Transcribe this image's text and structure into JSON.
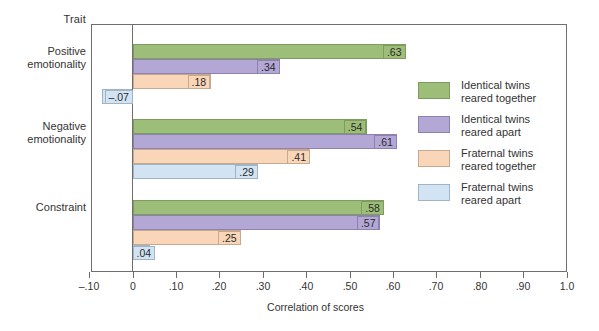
{
  "chart_data": {
    "type": "bar",
    "orientation": "horizontal",
    "title": "",
    "corner_label": "Trait",
    "xlabel": "Correlation of scores",
    "ylabel": "",
    "xlim": [
      -0.1,
      1.0
    ],
    "xticks": [
      "–.10",
      "0",
      ".10",
      ".20",
      ".30",
      ".40",
      ".50",
      ".60",
      ".70",
      ".80",
      ".90",
      "1.0"
    ],
    "xtick_values": [
      -0.1,
      0,
      0.1,
      0.2,
      0.3,
      0.4,
      0.5,
      0.6,
      0.7,
      0.8,
      0.9,
      1.0
    ],
    "grid": false,
    "legend_position": "right",
    "categories": [
      "Positive emotionality",
      "Negative emotionality",
      "Constraint"
    ],
    "category_lines": [
      [
        "Positive",
        "emotionality"
      ],
      [
        "Negative",
        "emotionality"
      ],
      [
        "Constraint",
        ""
      ]
    ],
    "series": [
      {
        "name": "Identical twins reared together",
        "legend_lines": [
          "Identical twins",
          "reared together"
        ],
        "color": "#9cbe78",
        "border": "#7e9c5f",
        "values": [
          0.63,
          0.54,
          0.58
        ],
        "labels": [
          ".63",
          ".54",
          ".58"
        ]
      },
      {
        "name": "Identical twins reared apart",
        "legend_lines": [
          "Identical twins",
          "reared apart"
        ],
        "color": "#b3a7d6",
        "border": "#8d82ad",
        "values": [
          0.34,
          0.61,
          0.57
        ],
        "labels": [
          ".34",
          ".61",
          ".57"
        ]
      },
      {
        "name": "Fraternal twins reared together",
        "legend_lines": [
          "Fraternal twins",
          "reared together"
        ],
        "color": "#fad6b8",
        "border": "#c9a890",
        "values": [
          0.18,
          0.41,
          0.25
        ],
        "labels": [
          ".18",
          ".41",
          ".25"
        ]
      },
      {
        "name": "Fraternal twins reared apart",
        "legend_lines": [
          "Fraternal twins",
          "reared apart"
        ],
        "color": "#d2e4f3",
        "border": "#9fb5c6",
        "values": [
          -0.07,
          0.29,
          0.04
        ],
        "labels": [
          "–.07",
          ".29",
          ".04"
        ]
      }
    ]
  }
}
